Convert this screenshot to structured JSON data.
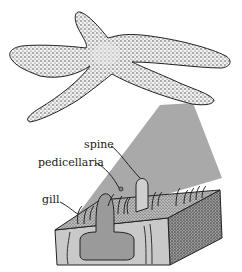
{
  "figure": {
    "inset": "cross-section of starfish body wall"
  },
  "labels": [
    {
      "id": "spine",
      "text": "spine"
    },
    {
      "id": "pedicellaria",
      "text": "pedicellaria"
    },
    {
      "id": "gill",
      "text": "gill"
    }
  ],
  "colors": {
    "cone": "#a8a8a8",
    "stipple": "#2a2a2a",
    "block_face": "#c8c8c8",
    "organ": "#9a9a9a",
    "outline": "#222222"
  }
}
